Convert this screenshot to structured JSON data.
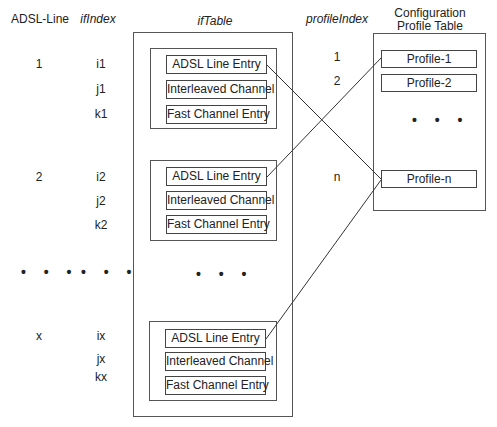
{
  "headers": {
    "adsl_line": "ADSL-Line",
    "if_index": "ifIndex",
    "if_table": "ifTable",
    "profile_index": "profileIndex",
    "config_table_line1": "Configuration",
    "config_table_line2": "Profile Table"
  },
  "groups": [
    {
      "adsl_line": "1",
      "indexes": [
        "i1",
        "j1",
        "k1"
      ],
      "entries": [
        "ADSL Line Entry",
        "Interleaved Channel",
        "Fast Channel Entry"
      ]
    },
    {
      "adsl_line": "2",
      "indexes": [
        "i2",
        "j2",
        "k2"
      ],
      "entries": [
        "ADSL Line Entry",
        "Interleaved Channel",
        "Fast Channel Entry"
      ]
    },
    {
      "adsl_line": "x",
      "indexes": [
        "ix",
        "jx",
        "kx"
      ],
      "entries": [
        "ADSL Line Entry",
        "Interleaved Channel",
        "Fast Channel Entry"
      ]
    }
  ],
  "ellipsis": "• • •",
  "profiles": [
    {
      "index": "1",
      "label": "Profile-1"
    },
    {
      "index": "2",
      "label": "Profile-2"
    },
    {
      "index": "n",
      "label": "Profile-n"
    }
  ],
  "connections": [
    {
      "from": "ADSL Line Entry (1)",
      "to": "Profile-n"
    },
    {
      "from": "ADSL Line Entry (2)",
      "to": "Profile-1"
    },
    {
      "from": "ADSL Line Entry (x)",
      "to": "Profile-n"
    }
  ]
}
